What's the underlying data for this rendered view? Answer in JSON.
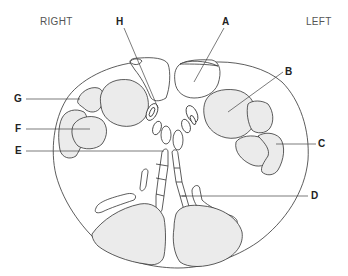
{
  "orientation": {
    "right": "RIGHT",
    "left": "LEFT"
  },
  "labels": [
    {
      "id": "A",
      "text": "A"
    },
    {
      "id": "B",
      "text": "B"
    },
    {
      "id": "C",
      "text": "C"
    },
    {
      "id": "D",
      "text": "D"
    },
    {
      "id": "E",
      "text": "E"
    },
    {
      "id": "F",
      "text": "F"
    },
    {
      "id": "G",
      "text": "G"
    },
    {
      "id": "H",
      "text": "H"
    }
  ],
  "colors": {
    "stroke": "#333333",
    "shaded_fill": "#ebebeb",
    "background": "#ffffff",
    "label_text": "#222222",
    "orientation_text": "#555555"
  }
}
